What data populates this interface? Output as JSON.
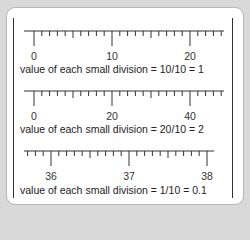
{
  "scales": [
    {
      "labels": [
        {
          "text": "0",
          "x": 34
        },
        {
          "text": "10",
          "x": 112
        },
        {
          "text": "20",
          "x": 190
        }
      ],
      "caption": "value of each small division = 10/10 = 1"
    },
    {
      "labels": [
        {
          "text": "0",
          "x": 34
        },
        {
          "text": "20",
          "x": 112
        },
        {
          "text": "40",
          "x": 190
        }
      ],
      "caption": "value of each small division = 20/10 = 2"
    },
    {
      "labels": [
        {
          "text": "36",
          "x": 51
        },
        {
          "text": "37",
          "x": 129
        },
        {
          "text": "38",
          "x": 207
        }
      ],
      "caption": "value of each small division = 1/10 = 0.1"
    }
  ],
  "colors": {
    "line": "#333333",
    "background": "#d9d9d9",
    "card": "#ffffff"
  }
}
